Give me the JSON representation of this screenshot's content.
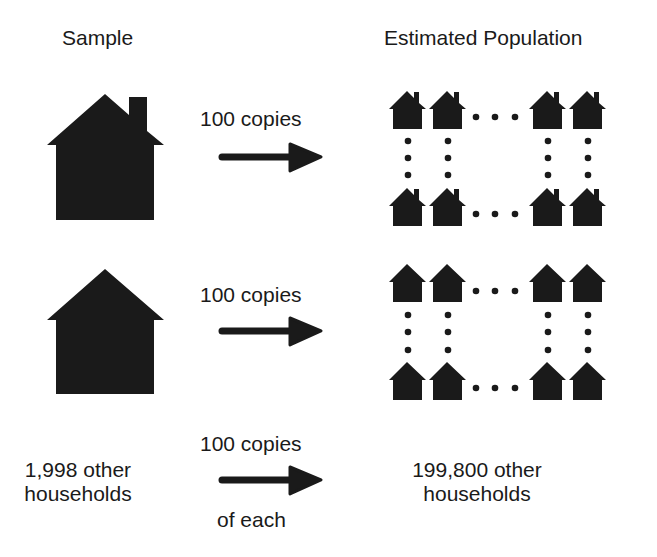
{
  "headers": {
    "sample": "Sample",
    "population": "Estimated Population"
  },
  "rows": [
    {
      "arrow_label": "100 copies",
      "sample_icon": "house-with-chimney-icon",
      "grid_icon": "small-house-with-chimney-icon"
    },
    {
      "arrow_label": "100 copies",
      "sample_icon": "house-icon",
      "grid_icon": "small-house-icon"
    }
  ],
  "bottom": {
    "left_line1": "1,998 other",
    "left_line2": "households",
    "arrow_label_top": "100 copies",
    "arrow_label_bottom": "of each",
    "right_line1": "199,800 other",
    "right_line2": "households"
  },
  "colors": {
    "fill": "#1a1a1a",
    "background": "#ffffff"
  }
}
